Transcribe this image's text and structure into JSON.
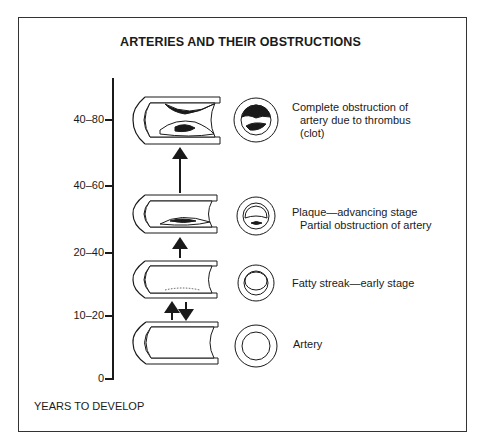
{
  "title": "ARTERIES AND THEIR OBSTRUCTIONS",
  "axis": {
    "label": "YEARS TO DEVELOP",
    "ticks": [
      {
        "label": "40–80",
        "y": 120
      },
      {
        "label": "40–60",
        "y": 186
      },
      {
        "label": "20–40",
        "y": 253
      },
      {
        "label": "10–20",
        "y": 316
      },
      {
        "label": "0",
        "y": 379
      }
    ]
  },
  "stages": [
    {
      "name": "clot",
      "caption_line1": "Complete obstruction of",
      "caption_line2": "artery due to thrombus",
      "caption_line3": "(clot)"
    },
    {
      "name": "plaque",
      "caption_line1": "Plaque—advancing stage",
      "caption_line2": "Partial obstruction of artery"
    },
    {
      "name": "fatty-streak",
      "caption_line1": "Fatty streak—early stage"
    },
    {
      "name": "artery",
      "caption_line1": "Artery"
    }
  ],
  "colors": {
    "ink": "#1a1a1a",
    "background": "#ffffff",
    "frame": "#333333"
  }
}
